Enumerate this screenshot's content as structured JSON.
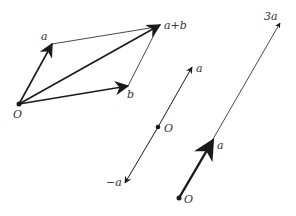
{
  "diagram": {
    "colors": {
      "stroke": "#1a1a1a",
      "label": "#333333",
      "background": "#ffffff"
    },
    "parallelogram": {
      "origin": {
        "label": "O",
        "x": 19,
        "y": 104
      },
      "vectors": [
        {
          "name": "a",
          "label": "a",
          "to": [
            52,
            44
          ]
        },
        {
          "name": "b",
          "label": "b",
          "to": [
            128,
            86
          ]
        },
        {
          "name": "a+b",
          "label": "a+b",
          "to": [
            160,
            25
          ]
        }
      ]
    },
    "negation": {
      "origin": {
        "label": "O",
        "x": 158,
        "y": 127
      },
      "vectors": [
        {
          "name": "a",
          "label": "a",
          "to": [
            192,
            67
          ]
        },
        {
          "name": "-a",
          "label": "−a",
          "to": [
            125,
            183
          ]
        }
      ]
    },
    "scaling": {
      "origin": {
        "label": "O",
        "x": 179,
        "y": 198
      },
      "vectors": [
        {
          "name": "a",
          "label": "a",
          "to": [
            213,
            140
          ]
        },
        {
          "name": "3a",
          "label": "3a",
          "to": [
            280,
            23
          ]
        }
      ]
    }
  }
}
